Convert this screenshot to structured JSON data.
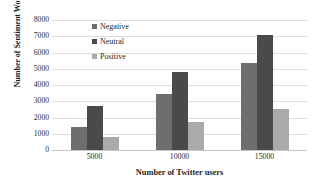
{
  "chart_data": {
    "type": "bar",
    "title": "",
    "xlabel": "Number of Twitter users",
    "ylabel": "Number  of Sentiment Words",
    "categories": [
      "5000",
      "10000",
      "15000"
    ],
    "series": [
      {
        "name": "Negative",
        "values": [
          1400,
          3450,
          5350
        ],
        "color": "#6e6e6e"
      },
      {
        "name": "Neutral",
        "values": [
          2700,
          4800,
          7050
        ],
        "color": "#4a4a4a"
      },
      {
        "name": "Positive",
        "values": [
          800,
          1700,
          2550
        ],
        "color": "#aaaaaa"
      }
    ],
    "ylim": [
      0,
      8000
    ],
    "ytick_labels": [
      "0",
      "1000",
      "2000",
      "3000",
      "4000",
      "5000",
      "6000",
      "7000",
      "8000"
    ],
    "ytick_values": [
      0,
      1000,
      2000,
      3000,
      4000,
      5000,
      6000,
      7000,
      8000
    ],
    "grid": true,
    "legend_position": "top-left-inside",
    "background_color": "#ffffff",
    "gridline_color": "#dddddd"
  }
}
